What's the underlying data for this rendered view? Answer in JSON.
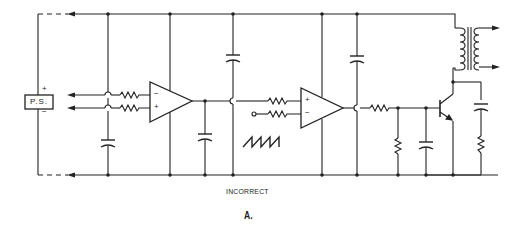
{
  "diagram": {
    "type": "circuit-schematic",
    "caption": "INCORRECT",
    "figure_label": "A.",
    "power_supply": {
      "label": "P.S.",
      "positive_symbol": "+",
      "negative_symbol": "−"
    },
    "opamp_1": {
      "inverting": "−",
      "non_inverting": "+"
    },
    "opamp_2": {
      "non_inverting": "+",
      "inverting": "−"
    },
    "components": [
      "power-supply",
      "input-arrow-1",
      "input-arrow-2",
      "resistor-in-1",
      "resistor-in-2",
      "capacitor-bypass-left",
      "opamp-1",
      "capacitor-output-1",
      "capacitor-top",
      "resistor-in-3",
      "resistor-in-4",
      "sawtooth-waveform",
      "opamp-2",
      "capacitor-top-2",
      "resistor-base",
      "resistor-pulldown",
      "capacitor-base",
      "npn-transistor",
      "transformer",
      "capacitor-snubber",
      "resistor-snubber"
    ],
    "colors": {
      "line": "#222222",
      "background": "#ffffff"
    }
  }
}
